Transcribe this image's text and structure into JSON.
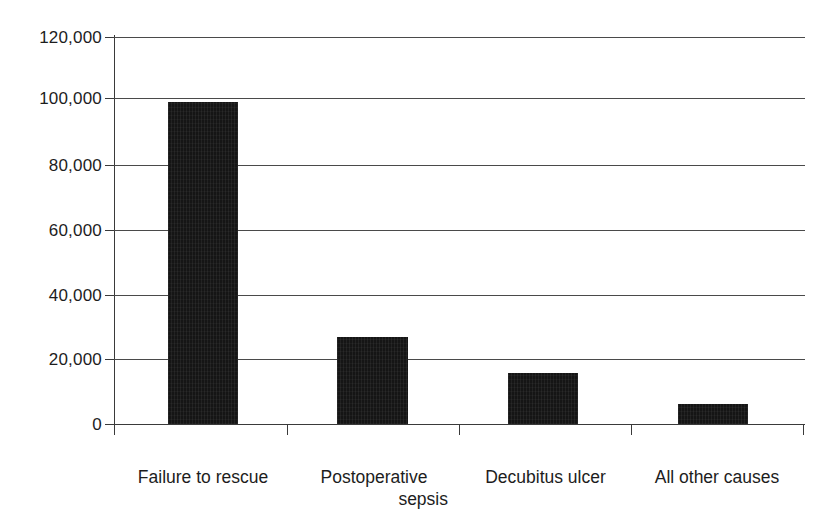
{
  "chart_data": {
    "type": "bar",
    "title": "",
    "subtitle": "",
    "xlabel": "",
    "ylabel": "",
    "categories": [
      "Failure to rescue",
      "Postoperative sepsis",
      "Decubitus ulcer",
      "All other causes"
    ],
    "category_lines": [
      [
        "Failure to rescue"
      ],
      [
        "Postoperative",
        "sepsis"
      ],
      [
        "Decubitus ulcer"
      ],
      [
        "All other causes"
      ]
    ],
    "values": [
      100000,
      27000,
      15800,
      6200
    ],
    "ylim": [
      0,
      120000
    ],
    "ytick_values": [
      0,
      20000,
      40000,
      60000,
      80000,
      100000,
      120000
    ],
    "ytick_labels": [
      "0",
      "20,000",
      "40,000",
      "60,000",
      "80,000",
      "100,000",
      "120,000"
    ],
    "grid": true,
    "grid_axis": "y",
    "legend": false,
    "legend_position": "none",
    "bar_color": "#151515",
    "axis_color": "#3a3a3a",
    "grid_color": "#4a4a4a",
    "background_color": "#ffffff",
    "annotations": []
  },
  "axis": {
    "y_labels": [
      "120,000",
      "100,000",
      "80,000",
      "60,000",
      "40,000",
      "20,000",
      "0"
    ]
  },
  "bars": [
    {
      "label": "Failure to rescue",
      "value": 100000
    },
    {
      "label": "Postoperative sepsis",
      "value": 27000
    },
    {
      "label": "Decubitus ulcer",
      "value": 15800
    },
    {
      "label": "All other causes",
      "value": 6200
    }
  ],
  "categories": {
    "c0_line1": "Failure to rescue",
    "c1_line1": "Postoperative",
    "c1_line2": "sepsis",
    "c2_line1": "Decubitus ulcer",
    "c3_line1": "All other causes"
  }
}
